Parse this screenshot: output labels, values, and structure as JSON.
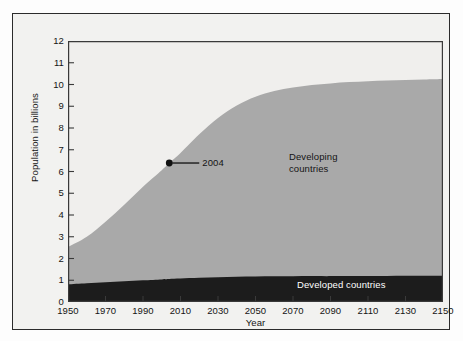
{
  "chart_data": {
    "type": "area",
    "title": "",
    "subtitle": "",
    "xlabel": "Year",
    "ylabel": "Population in billions",
    "xlim": [
      1950,
      2150
    ],
    "ylim": [
      0,
      12
    ],
    "grid": false,
    "legend_position": "inline-labels",
    "xticks": [
      1950,
      1970,
      1990,
      2010,
      2030,
      2050,
      2070,
      2090,
      2110,
      2130,
      2150
    ],
    "yticks": [
      0,
      1,
      2,
      3,
      4,
      5,
      6,
      7,
      8,
      9,
      10,
      11,
      12
    ],
    "stacked": true,
    "x": [
      1950,
      1960,
      1970,
      1980,
      1990,
      2000,
      2004,
      2010,
      2020,
      2030,
      2040,
      2050,
      2060,
      2070,
      2080,
      2090,
      2100,
      2110,
      2120,
      2130,
      2140,
      2150
    ],
    "series": [
      {
        "name": "Developed countries",
        "color": "#1c1c1c",
        "label": "Developed countries",
        "values": [
          0.81,
          0.86,
          0.91,
          0.95,
          1.0,
          1.04,
          1.06,
          1.08,
          1.11,
          1.14,
          1.16,
          1.17,
          1.18,
          1.18,
          1.19,
          1.19,
          1.2,
          1.2,
          1.2,
          1.21,
          1.21,
          1.21
        ]
      },
      {
        "name": "Developing countries",
        "color": "#a9a9a9",
        "label": "Developing\ncountries",
        "values": [
          1.72,
          2.14,
          2.78,
          3.52,
          4.3,
          5.02,
          5.33,
          5.77,
          6.6,
          7.32,
          7.88,
          8.27,
          8.52,
          8.68,
          8.79,
          8.86,
          8.91,
          8.95,
          8.98,
          9.0,
          9.02,
          9.04
        ]
      }
    ],
    "total": [
      2.53,
      3.0,
      3.69,
      4.47,
      5.3,
      6.06,
      6.39,
      6.85,
      7.71,
      8.46,
      9.04,
      9.44,
      9.7,
      9.86,
      9.98,
      10.05,
      10.11,
      10.15,
      10.18,
      10.21,
      10.23,
      10.25
    ],
    "annotations": [
      {
        "name": "2004-marker",
        "label": "2004",
        "x": 2004,
        "y": 6.39,
        "marker": "filled-circle",
        "leader_line": true
      }
    ]
  },
  "axes": {
    "y_title": "Population in billions",
    "x_title": "Year",
    "y_tick_labels": [
      "12",
      "11",
      "10",
      "9",
      "8",
      "7",
      "6",
      "5",
      "4",
      "3",
      "2",
      "1",
      "0"
    ],
    "x_tick_labels": [
      "1950",
      "1970",
      "1990",
      "2010",
      "2030",
      "2050",
      "2070",
      "2090",
      "2110",
      "2130",
      "2150"
    ]
  },
  "labels": {
    "developing_line1": "Developing",
    "developing_line2": "countries",
    "developed": "Developed countries",
    "annotation_2004": "2004"
  },
  "colors": {
    "developed_fill": "#1c1c1c",
    "developing_fill": "#a9a9a9",
    "plot_background": "#f0efed",
    "figure_background": "#f2f2f0",
    "frame_border": "#2b2b2b",
    "axis_line": "#3a3a3a",
    "text": "#141414",
    "label_on_dark": "#ffffff"
  }
}
